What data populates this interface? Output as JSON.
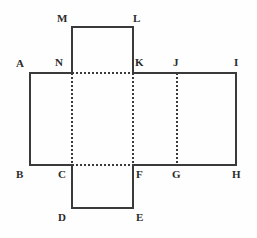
{
  "figure": {
    "name": "cube-net-diagram",
    "type": "geometry-net",
    "background_color": "#fefefe",
    "stroke_color": "#3a3a3a",
    "dashed_stroke_color": "#3a3a3a",
    "solid_stroke_width": 1.2,
    "dashed_stroke_width": 1.2,
    "dash_pattern": "2 2"
  },
  "vertices": [
    {
      "id": "A",
      "label": "A",
      "x": 30,
      "y": 73,
      "label_x": 16,
      "label_y": 58
    },
    {
      "id": "B",
      "label": "B",
      "x": 30,
      "y": 165,
      "label_x": 16,
      "label_y": 169
    },
    {
      "id": "C",
      "label": "C",
      "x": 72,
      "y": 165,
      "label_x": 58,
      "label_y": 169
    },
    {
      "id": "D",
      "label": "D",
      "x": 72,
      "y": 208,
      "label_x": 58,
      "label_y": 212
    },
    {
      "id": "E",
      "label": "E",
      "x": 133,
      "y": 208,
      "label_x": 136,
      "label_y": 212
    },
    {
      "id": "F",
      "label": "F",
      "x": 133,
      "y": 165,
      "label_x": 136,
      "label_y": 169
    },
    {
      "id": "G",
      "label": "G",
      "x": 177,
      "y": 165,
      "label_x": 172,
      "label_y": 169
    },
    {
      "id": "H",
      "label": "H",
      "x": 236,
      "y": 165,
      "label_x": 232,
      "label_y": 169
    },
    {
      "id": "I",
      "label": "I",
      "x": 236,
      "y": 73,
      "label_x": 234,
      "label_y": 57
    },
    {
      "id": "J",
      "label": "J",
      "x": 177,
      "y": 73,
      "label_x": 173,
      "label_y": 57
    },
    {
      "id": "K",
      "label": "K",
      "x": 133,
      "y": 73,
      "label_x": 135,
      "label_y": 57
    },
    {
      "id": "L",
      "label": "L",
      "x": 133,
      "y": 27,
      "label_x": 133,
      "label_y": 13
    },
    {
      "id": "M",
      "label": "M",
      "x": 72,
      "y": 27,
      "label_x": 57,
      "label_y": 13
    },
    {
      "id": "N",
      "label": "N",
      "x": 72,
      "y": 73,
      "label_x": 55,
      "label_y": 57
    }
  ],
  "solid_edges": [
    {
      "name": "edge-M-L",
      "from": "M",
      "to": "L",
      "x1": 72,
      "y1": 27,
      "x2": 133,
      "y2": 27
    },
    {
      "name": "edge-M-N",
      "from": "M",
      "to": "N",
      "x1": 72,
      "y1": 27,
      "x2": 72,
      "y2": 73
    },
    {
      "name": "edge-L-K",
      "from": "L",
      "to": "K",
      "x1": 133,
      "y1": 27,
      "x2": 133,
      "y2": 73
    },
    {
      "name": "edge-A-N",
      "from": "A",
      "to": "N",
      "x1": 30,
      "y1": 73,
      "x2": 72,
      "y2": 73
    },
    {
      "name": "edge-K-I",
      "from": "K",
      "to": "I",
      "x1": 133,
      "y1": 73,
      "x2": 236,
      "y2": 73
    },
    {
      "name": "edge-A-B",
      "from": "A",
      "to": "B",
      "x1": 30,
      "y1": 73,
      "x2": 30,
      "y2": 165
    },
    {
      "name": "edge-I-H",
      "from": "I",
      "to": "H",
      "x1": 236,
      "y1": 73,
      "x2": 236,
      "y2": 165
    },
    {
      "name": "edge-B-C",
      "from": "B",
      "to": "C",
      "x1": 30,
      "y1": 165,
      "x2": 72,
      "y2": 165
    },
    {
      "name": "edge-F-H",
      "from": "F",
      "to": "H",
      "x1": 133,
      "y1": 165,
      "x2": 236,
      "y2": 165
    },
    {
      "name": "edge-C-D",
      "from": "C",
      "to": "D",
      "x1": 72,
      "y1": 165,
      "x2": 72,
      "y2": 208
    },
    {
      "name": "edge-F-E",
      "from": "F",
      "to": "E",
      "x1": 133,
      "y1": 165,
      "x2": 133,
      "y2": 208
    },
    {
      "name": "edge-D-E",
      "from": "D",
      "to": "E",
      "x1": 72,
      "y1": 208,
      "x2": 133,
      "y2": 208
    }
  ],
  "dashed_edges": [
    {
      "name": "edge-N-K",
      "from": "N",
      "to": "K",
      "x1": 72,
      "y1": 73,
      "x2": 133,
      "y2": 73
    },
    {
      "name": "edge-C-F",
      "from": "C",
      "to": "F",
      "x1": 72,
      "y1": 165,
      "x2": 133,
      "y2": 165
    },
    {
      "name": "edge-N-C",
      "from": "N",
      "to": "C",
      "x1": 72,
      "y1": 73,
      "x2": 72,
      "y2": 165
    },
    {
      "name": "edge-K-F",
      "from": "K",
      "to": "F",
      "x1": 133,
      "y1": 73,
      "x2": 133,
      "y2": 165
    },
    {
      "name": "edge-J-G",
      "from": "J",
      "to": "G",
      "x1": 177,
      "y1": 73,
      "x2": 177,
      "y2": 165
    }
  ]
}
